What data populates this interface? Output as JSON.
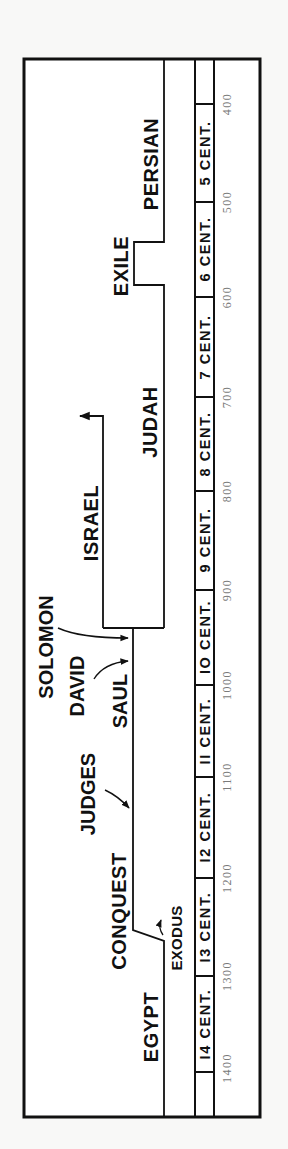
{
  "diagram": {
    "type": "timeline",
    "orientation": "rotated -90deg (read bottom to top)",
    "periods": [
      {
        "id": "egypt",
        "label": "EGYPT",
        "x": 151,
        "y": 1027
      },
      {
        "id": "exodus",
        "label": "EXODUS",
        "x": 176,
        "y": 938
      },
      {
        "id": "conquest",
        "label": "CONQUEST",
        "x": 119,
        "y": 911
      },
      {
        "id": "judges",
        "label": "JUDGES",
        "x": 88,
        "y": 794
      },
      {
        "id": "saul",
        "label": "SAUL",
        "x": 120,
        "y": 701
      },
      {
        "id": "david",
        "label": "DAVID",
        "x": 77,
        "y": 686
      },
      {
        "id": "solomon",
        "label": "SOLOMON",
        "x": 46,
        "y": 647
      },
      {
        "id": "israel",
        "label": "ISRAEL",
        "x": 91,
        "y": 523
      },
      {
        "id": "judah",
        "label": "JUDAH",
        "x": 150,
        "y": 422
      },
      {
        "id": "exile",
        "label": "EXILE",
        "x": 121,
        "y": 266
      },
      {
        "id": "persian",
        "label": "PERSIAN",
        "x": 151,
        "y": 164
      }
    ],
    "centuries": [
      {
        "label": "I4 CENT.",
        "y": 1024
      },
      {
        "label": "I3 CENT.",
        "y": 927
      },
      {
        "label": "I2 CENT.",
        "y": 827
      },
      {
        "label": "II CENT.",
        "y": 731
      },
      {
        "label": "IO CENT.",
        "y": 637
      },
      {
        "label": "9 CENT.",
        "y": 540
      },
      {
        "label": "8 CENT.",
        "y": 444
      },
      {
        "label": "7 CENT.",
        "y": 347
      },
      {
        "label": "6 CENT.",
        "y": 249
      },
      {
        "label": "5 CENT.",
        "y": 153
      }
    ],
    "years": [
      {
        "label": "1400",
        "y": 1072
      },
      {
        "label": "1300",
        "y": 976
      },
      {
        "label": "1200",
        "y": 878
      },
      {
        "label": "1100",
        "y": 777
      },
      {
        "label": "1000",
        "y": 685
      },
      {
        "label": "900",
        "y": 590
      },
      {
        "label": "800",
        "y": 491
      },
      {
        "label": "700",
        "y": 397
      },
      {
        "label": "600",
        "y": 297
      },
      {
        "label": "500",
        "y": 202
      },
      {
        "label": "400",
        "y": 104
      }
    ],
    "colors": {
      "ink": "#111111",
      "year_text": "#7a7a7a",
      "paper": "#ffffff",
      "background": "#f8f8f7"
    }
  }
}
